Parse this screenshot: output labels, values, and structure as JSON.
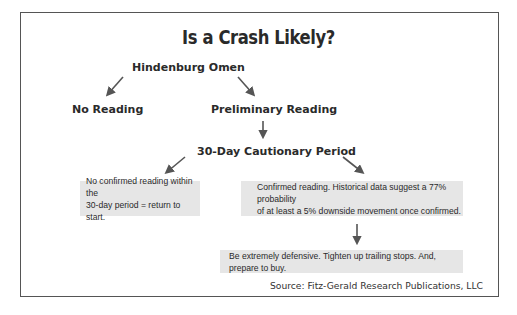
{
  "diagram": {
    "title": "Is a Crash Likely?",
    "nodes": {
      "root": "Hindenburg Omen",
      "no_reading": "No Reading",
      "preliminary_reading": "Preliminary Reading",
      "cautionary_period": "30-Day Cautionary Period"
    },
    "boxes": {
      "no_confirmation": {
        "line1": "No confirmed reading within the",
        "line2": "30-day period = return to start."
      },
      "confirmed": {
        "line1": "Confirmed reading.  Historical data suggest a 77% probability",
        "line2": "of at least a 5% downside movement once confirmed."
      },
      "action": {
        "line1": "Be extremely defensive. Tighten up trailing stops. And, prepare to buy."
      }
    },
    "source": "Source: Fitz-Gerald Research Publications, LLC",
    "colors": {
      "box_fill": "#e6e6e6",
      "arrow": "#555555",
      "border": "#555555"
    }
  }
}
